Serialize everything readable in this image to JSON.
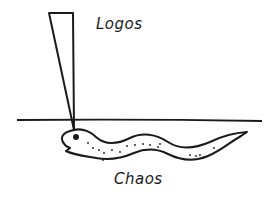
{
  "diagram": {
    "labels": {
      "top": "Logos",
      "bottom": "Chaos"
    },
    "elements": [
      {
        "name": "wedge",
        "description": "narrow inverted triangle descending from top, tip touching serpent head"
      },
      {
        "name": "horizon-line",
        "description": "horizontal line dividing upper and lower regions"
      },
      {
        "name": "serpent",
        "description": "wavy serpent/eel with dotted body below the line, open mouth on left"
      }
    ],
    "colors": {
      "ink": "#1a1a1a",
      "background": "#ffffff"
    }
  }
}
